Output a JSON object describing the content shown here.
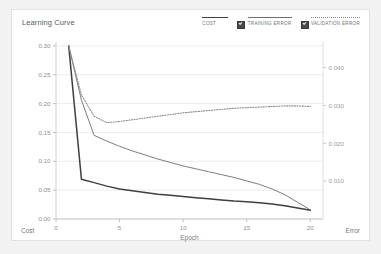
{
  "card": {
    "title": "Learning Curve"
  },
  "legend": {
    "position": "top-right",
    "items": [
      {
        "label": "COST",
        "swatch": "solid-thick",
        "color": "#3f3f3f",
        "checkbox": false
      },
      {
        "label": "TRAINING ERROR",
        "swatch": "solid-thin",
        "color": "#6e6e6e",
        "checkbox": true
      },
      {
        "label": "VALIDATION ERROR",
        "swatch": "dotted",
        "color": "#8a8a8a",
        "checkbox": true
      }
    ]
  },
  "corner_labels": {
    "left": "Cost",
    "right": "Error"
  },
  "chart_data": {
    "type": "line",
    "title": "Learning Curve",
    "xlabel": "Epoch",
    "ylabel": "Cost",
    "y2label": "Error",
    "grid": true,
    "legend_position": "top-right",
    "x": [
      1,
      2,
      3,
      4,
      5,
      6,
      7,
      8,
      9,
      10,
      11,
      12,
      13,
      14,
      15,
      16,
      17,
      18,
      19,
      20
    ],
    "xlim": [
      0,
      21
    ],
    "xticks": [
      0,
      5,
      10,
      15,
      20
    ],
    "xtick_labels": [
      "0",
      "5",
      "10",
      "15",
      "20"
    ],
    "ylim": [
      0.0,
      0.305
    ],
    "yticks": [
      0.0,
      0.05,
      0.1,
      0.15,
      0.2,
      0.25,
      0.3
    ],
    "ytick_labels": [
      "0.00",
      "0.05",
      "0.10",
      "0.15",
      "0.20",
      "0.25",
      "0.30"
    ],
    "y2lim": [
      0.0,
      0.0465
    ],
    "y2ticks": [
      0.01,
      0.02,
      0.03,
      0.04
    ],
    "y2tick_labels": [
      "0.010",
      "0.020",
      "0.030",
      "0.040"
    ],
    "series": [
      {
        "name": "COST",
        "axis": "left",
        "style": "solid",
        "width": 1.5,
        "color": "#3f3f3f",
        "values": [
          0.3,
          0.069,
          0.063,
          0.057,
          0.052,
          0.049,
          0.046,
          0.043,
          0.041,
          0.039,
          0.037,
          0.035,
          0.033,
          0.031,
          0.03,
          0.028,
          0.026,
          0.023,
          0.019,
          0.015
        ]
      },
      {
        "name": "TRAINING ERROR",
        "axis": "left",
        "style": "solid",
        "width": 0.9,
        "color": "#6e6e6e",
        "values": [
          0.3,
          0.206,
          0.145,
          0.135,
          0.126,
          0.118,
          0.111,
          0.104,
          0.098,
          0.092,
          0.087,
          0.082,
          0.077,
          0.072,
          0.066,
          0.06,
          0.052,
          0.042,
          0.029,
          0.016
        ]
      },
      {
        "name": "VALIDATION ERROR",
        "axis": "left",
        "style": "dotted",
        "width": 1.1,
        "color": "#8a8a8a",
        "values": [
          0.3,
          0.215,
          0.178,
          0.167,
          0.169,
          0.172,
          0.175,
          0.178,
          0.181,
          0.184,
          0.186,
          0.188,
          0.19,
          0.192,
          0.193,
          0.194,
          0.195,
          0.196,
          0.196,
          0.195
        ]
      }
    ]
  }
}
